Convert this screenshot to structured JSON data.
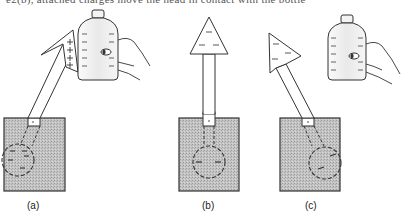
{
  "header": {
    "clipped_text": "e2(b), attached charges move the head in contact with the bottle"
  },
  "figure": {
    "panels": [
      {
        "label": "(a)",
        "description": "Charged bottle near electroscope; plus charges induced on arrow head, minus charges in bulb; arrow deflects left"
      },
      {
        "label": "(b)",
        "description": "Electroscope with arrow upright; minus charges in head and bulb"
      },
      {
        "label": "(c)",
        "description": "Bottle removed; arrow remains deflected; minus charges in head and bulb"
      }
    ],
    "colors": {
      "ink": "#2a2a2a",
      "box_fill": "#bdbdbd",
      "bottle_fill": "#efefef"
    }
  }
}
